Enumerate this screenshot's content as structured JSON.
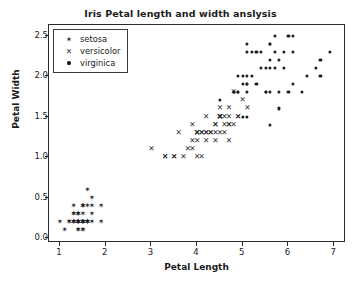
{
  "chart_data": {
    "type": "scatter",
    "title": "Iris Petal length and width anslysis",
    "xlabel": "Petal Length",
    "ylabel": "Petal Width",
    "xlim": [
      0.76,
      7.26
    ],
    "ylim": [
      -0.06,
      2.63
    ],
    "grid": false,
    "legend_position": "upper left",
    "xticks": [
      1,
      2,
      3,
      4,
      5,
      6,
      7
    ],
    "xticklabels": [
      "1",
      "2",
      "3",
      "4",
      "5",
      "6",
      "7"
    ],
    "yticks": [
      0.0,
      0.5,
      1.0,
      1.5,
      2.0,
      2.5
    ],
    "yticklabels": [
      "0.0",
      "0.5",
      "1.0",
      "1.5",
      "2.0",
      "2.5"
    ],
    "marker_color": "#1f1f1f",
    "series": [
      {
        "name": "setosa",
        "marker": "star",
        "marker_glyph": "✶",
        "points": [
          [
            1.4,
            0.2
          ],
          [
            1.4,
            0.2
          ],
          [
            1.3,
            0.2
          ],
          [
            1.5,
            0.2
          ],
          [
            1.4,
            0.2
          ],
          [
            1.7,
            0.4
          ],
          [
            1.4,
            0.3
          ],
          [
            1.5,
            0.2
          ],
          [
            1.4,
            0.2
          ],
          [
            1.5,
            0.1
          ],
          [
            1.5,
            0.2
          ],
          [
            1.6,
            0.2
          ],
          [
            1.4,
            0.1
          ],
          [
            1.1,
            0.1
          ],
          [
            1.2,
            0.2
          ],
          [
            1.5,
            0.4
          ],
          [
            1.3,
            0.4
          ],
          [
            1.4,
            0.3
          ],
          [
            1.7,
            0.3
          ],
          [
            1.5,
            0.3
          ],
          [
            1.7,
            0.2
          ],
          [
            1.5,
            0.4
          ],
          [
            1.0,
            0.2
          ],
          [
            1.7,
            0.5
          ],
          [
            1.9,
            0.2
          ],
          [
            1.6,
            0.2
          ],
          [
            1.6,
            0.4
          ],
          [
            1.5,
            0.2
          ],
          [
            1.4,
            0.2
          ],
          [
            1.6,
            0.2
          ],
          [
            1.6,
            0.2
          ],
          [
            1.5,
            0.4
          ],
          [
            1.5,
            0.1
          ],
          [
            1.4,
            0.2
          ],
          [
            1.5,
            0.2
          ],
          [
            1.2,
            0.2
          ],
          [
            1.3,
            0.2
          ],
          [
            1.4,
            0.1
          ],
          [
            1.3,
            0.2
          ],
          [
            1.5,
            0.2
          ],
          [
            1.3,
            0.3
          ],
          [
            1.3,
            0.3
          ],
          [
            1.3,
            0.2
          ],
          [
            1.6,
            0.6
          ],
          [
            1.9,
            0.4
          ],
          [
            1.4,
            0.3
          ],
          [
            1.6,
            0.2
          ],
          [
            1.4,
            0.2
          ],
          [
            1.5,
            0.2
          ],
          [
            1.4,
            0.2
          ]
        ]
      },
      {
        "name": "versicolor",
        "marker": "x",
        "marker_glyph": "✕",
        "points": [
          [
            4.7,
            1.4
          ],
          [
            4.5,
            1.5
          ],
          [
            4.9,
            1.5
          ],
          [
            4.0,
            1.3
          ],
          [
            4.6,
            1.5
          ],
          [
            4.5,
            1.3
          ],
          [
            4.7,
            1.6
          ],
          [
            3.3,
            1.0
          ],
          [
            4.6,
            1.3
          ],
          [
            3.9,
            1.4
          ],
          [
            3.5,
            1.0
          ],
          [
            4.2,
            1.5
          ],
          [
            4.0,
            1.0
          ],
          [
            4.7,
            1.4
          ],
          [
            3.6,
            1.3
          ],
          [
            4.4,
            1.4
          ],
          [
            4.5,
            1.5
          ],
          [
            4.1,
            1.0
          ],
          [
            4.5,
            1.5
          ],
          [
            3.9,
            1.1
          ],
          [
            4.8,
            1.8
          ],
          [
            4.0,
            1.3
          ],
          [
            4.9,
            1.5
          ],
          [
            4.7,
            1.2
          ],
          [
            4.3,
            1.3
          ],
          [
            4.4,
            1.4
          ],
          [
            4.8,
            1.4
          ],
          [
            5.0,
            1.7
          ],
          [
            4.5,
            1.5
          ],
          [
            3.5,
            1.0
          ],
          [
            3.8,
            1.1
          ],
          [
            3.7,
            1.0
          ],
          [
            3.9,
            1.2
          ],
          [
            5.1,
            1.6
          ],
          [
            4.5,
            1.5
          ],
          [
            4.5,
            1.6
          ],
          [
            4.7,
            1.5
          ],
          [
            4.4,
            1.3
          ],
          [
            4.1,
            1.3
          ],
          [
            4.0,
            1.3
          ],
          [
            4.4,
            1.2
          ],
          [
            4.6,
            1.4
          ],
          [
            4.0,
            1.2
          ],
          [
            3.3,
            1.0
          ],
          [
            4.2,
            1.3
          ],
          [
            4.2,
            1.2
          ],
          [
            4.2,
            1.3
          ],
          [
            4.3,
            1.3
          ],
          [
            3.0,
            1.1
          ],
          [
            4.1,
            1.3
          ]
        ]
      },
      {
        "name": "virginica",
        "marker": "dot",
        "marker_glyph": "●",
        "points": [
          [
            6.0,
            2.5
          ],
          [
            5.1,
            1.9
          ],
          [
            5.9,
            2.1
          ],
          [
            5.6,
            1.8
          ],
          [
            5.8,
            2.2
          ],
          [
            6.6,
            2.1
          ],
          [
            4.5,
            1.7
          ],
          [
            6.3,
            1.8
          ],
          [
            5.8,
            1.8
          ],
          [
            6.1,
            2.5
          ],
          [
            5.1,
            2.0
          ],
          [
            5.3,
            1.9
          ],
          [
            5.5,
            2.1
          ],
          [
            5.0,
            2.0
          ],
          [
            5.1,
            2.4
          ],
          [
            5.3,
            2.3
          ],
          [
            5.5,
            1.8
          ],
          [
            6.7,
            2.2
          ],
          [
            6.9,
            2.3
          ],
          [
            5.0,
            1.5
          ],
          [
            5.7,
            2.3
          ],
          [
            4.9,
            2.0
          ],
          [
            6.7,
            2.0
          ],
          [
            4.9,
            1.8
          ],
          [
            5.7,
            2.1
          ],
          [
            6.0,
            1.8
          ],
          [
            4.8,
            1.8
          ],
          [
            4.9,
            1.8
          ],
          [
            5.6,
            2.1
          ],
          [
            5.8,
            1.6
          ],
          [
            6.1,
            1.9
          ],
          [
            6.4,
            2.0
          ],
          [
            5.6,
            2.2
          ],
          [
            5.1,
            1.5
          ],
          [
            5.6,
            1.4
          ],
          [
            6.1,
            2.3
          ],
          [
            5.6,
            2.4
          ],
          [
            5.5,
            1.8
          ],
          [
            4.8,
            1.8
          ],
          [
            5.4,
            2.1
          ],
          [
            5.6,
            2.4
          ],
          [
            5.1,
            2.3
          ],
          [
            5.1,
            1.9
          ],
          [
            5.9,
            2.3
          ],
          [
            5.7,
            2.5
          ],
          [
            5.2,
            2.3
          ],
          [
            5.0,
            1.9
          ],
          [
            5.2,
            2.0
          ],
          [
            5.4,
            2.3
          ],
          [
            5.1,
            1.8
          ]
        ]
      }
    ]
  },
  "legend": {
    "entries": [
      {
        "label": "setosa"
      },
      {
        "label": "versicolor"
      },
      {
        "label": "virginica"
      }
    ]
  }
}
